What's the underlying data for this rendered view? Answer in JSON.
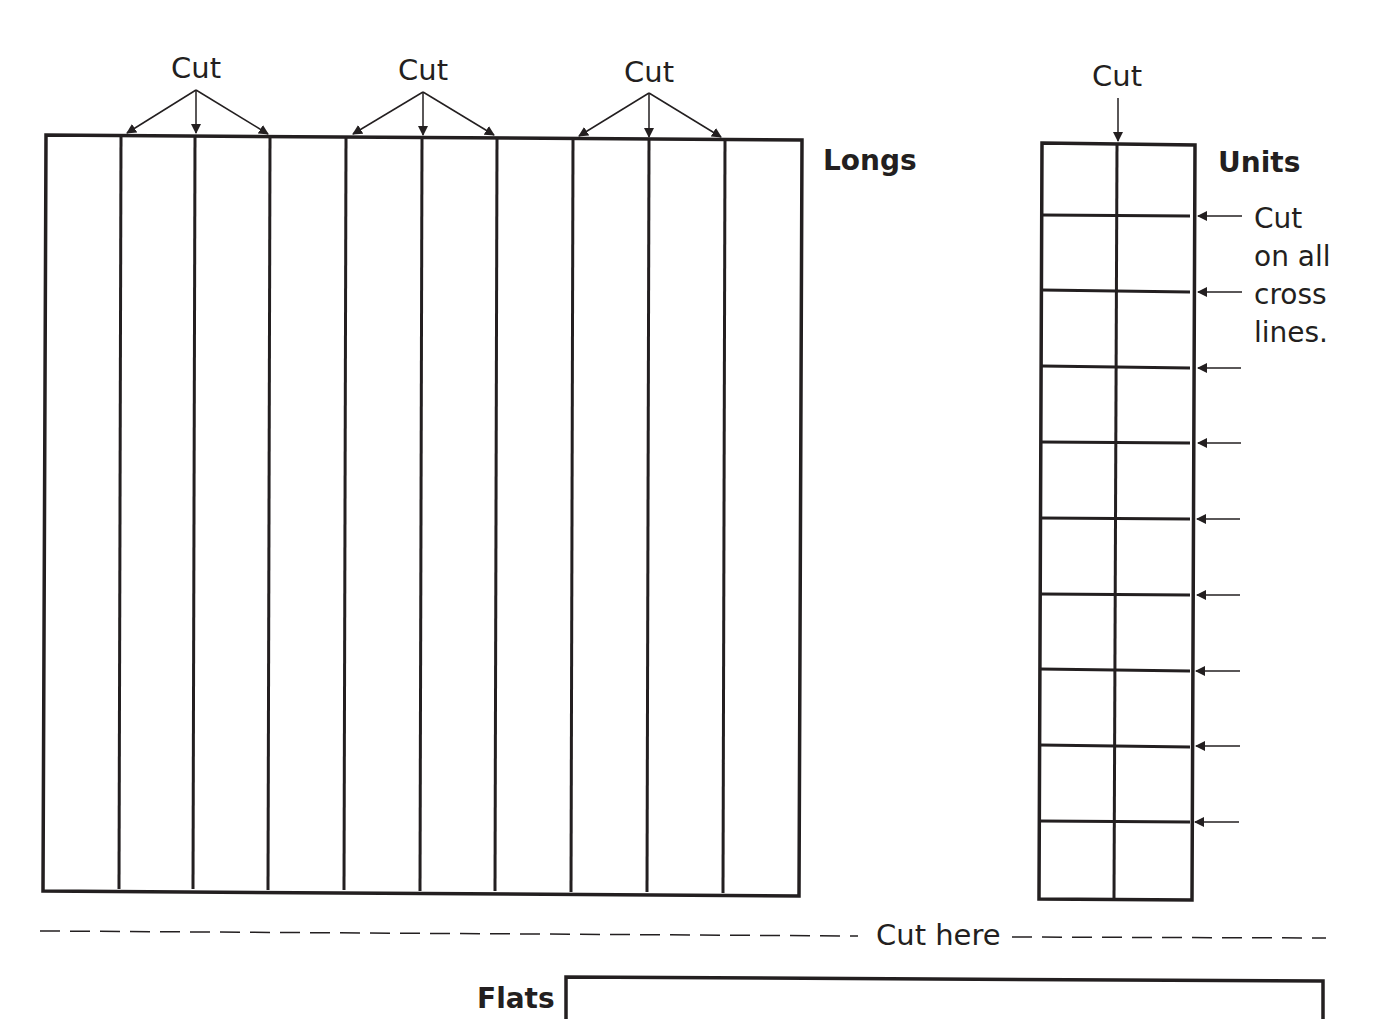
{
  "page": {
    "sections": {
      "longs": {
        "label": "Longs",
        "strips": 10,
        "cut_label": "Cut",
        "cut_groups": 3
      },
      "units": {
        "label": "Units",
        "columns": 2,
        "rows": 10,
        "top_cut_label": "Cut",
        "side_note_lines": [
          "Cut",
          "on all",
          "cross",
          "lines."
        ]
      },
      "divider": {
        "label": "Cut here"
      },
      "flats": {
        "label": "Flats"
      }
    },
    "colors": {
      "ink": "#231f20",
      "background": "#ffffff"
    }
  }
}
